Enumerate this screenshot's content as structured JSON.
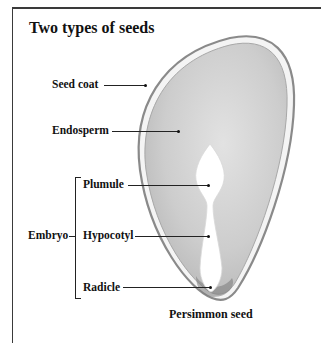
{
  "title": "Two types of seeds",
  "labels": {
    "seed_coat": "Seed coat",
    "endosperm": "Endosperm",
    "plumule": "Plumule",
    "hypocotyl": "Hypocotyl",
    "radicle": "Radicle",
    "embryo": "Embryo"
  },
  "caption": "Persimmon seed",
  "colors": {
    "frame": "#3a3a3a",
    "seed_coat": "#9a9a9a",
    "endosperm": "#c8c8c8",
    "embryo": "#ffffff",
    "text": "#111111"
  }
}
